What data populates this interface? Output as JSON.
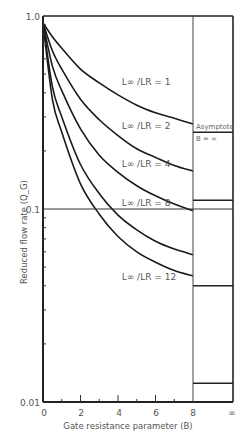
{
  "chart_data": {
    "type": "line",
    "title": "",
    "xlabel": "Gate resistance parameter (B)",
    "ylabel": "Reduced flow rate (Q_G)",
    "xscale": "linear",
    "yscale": "log",
    "xlim": [
      0,
      8
    ],
    "ylim": [
      0.01,
      1.0
    ],
    "x_ticks": [
      "0",
      "2",
      "4",
      "6",
      "8",
      "∞"
    ],
    "y_tick_labels": [
      "1.0",
      "0.1",
      "0.01"
    ],
    "grid": false,
    "reference_line": {
      "y": 0.1
    },
    "asymptote_panel": {
      "label_line1": "Asymptote",
      "label_line2": "B = ∞"
    },
    "series": [
      {
        "name": "L∞/LR = 1",
        "label": "L∞ /LR = 1",
        "x": [
          0,
          0.5,
          1,
          2,
          3,
          4,
          5,
          6,
          7,
          8
        ],
        "values": [
          0.92,
          0.78,
          0.68,
          0.53,
          0.45,
          0.39,
          0.345,
          0.315,
          0.295,
          0.276
        ],
        "asymptote": 0.25
      },
      {
        "name": "L∞/LR = 2",
        "label": "L∞ /LR = 2",
        "x": [
          0,
          0.5,
          1,
          2,
          3,
          4,
          5,
          6,
          7,
          8
        ],
        "values": [
          0.92,
          0.66,
          0.53,
          0.37,
          0.29,
          0.24,
          0.205,
          0.185,
          0.168,
          0.157
        ],
        "asymptote": 0.111
      },
      {
        "name": "L∞/LR = 4",
        "label": "L∞ /LR = 4",
        "x": [
          0,
          0.5,
          1,
          2,
          3,
          4,
          5,
          6,
          7,
          8
        ],
        "values": [
          0.92,
          0.55,
          0.41,
          0.26,
          0.19,
          0.155,
          0.132,
          0.117,
          0.106,
          0.098
        ],
        "asymptote": 0.111
      },
      {
        "name": "L∞/LR = 8",
        "label": "L∞ /LR = 8",
        "x": [
          0,
          0.5,
          1,
          2,
          3,
          4,
          5,
          6,
          7,
          8
        ],
        "values": [
          0.92,
          0.43,
          0.3,
          0.17,
          0.12,
          0.093,
          0.078,
          0.068,
          0.062,
          0.058
        ],
        "asymptote": 0.04
      },
      {
        "name": "L∞/LR = 12",
        "label": "L∞ /LR = 12",
        "x": [
          0,
          0.5,
          1,
          2,
          3,
          4,
          5,
          6,
          7,
          8
        ],
        "values": [
          0.92,
          0.37,
          0.25,
          0.135,
          0.094,
          0.072,
          0.06,
          0.053,
          0.048,
          0.045
        ],
        "asymptote": 0.0125
      }
    ],
    "asymptote_lines": [
      0.25,
      0.111,
      0.04,
      0.0125
    ],
    "label_positions": [
      {
        "x": 4.2,
        "y": 0.44
      },
      {
        "x": 4.2,
        "y": 0.26
      },
      {
        "x": 4.2,
        "y": 0.165
      },
      {
        "x": 4.2,
        "y": 0.104
      },
      {
        "x": 4.2,
        "y": 0.043
      }
    ]
  }
}
